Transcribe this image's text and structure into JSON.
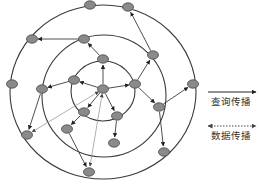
{
  "diagram": {
    "type": "concentric-ring-network",
    "rings": [
      {
        "name": "inner",
        "cx": 103,
        "cy": 91,
        "rx": 32,
        "ry": 30
      },
      {
        "name": "middle",
        "cx": 104,
        "cy": 96,
        "rx": 62,
        "ry": 61
      },
      {
        "name": "outer",
        "cx": 103,
        "cy": 92,
        "rx": 93,
        "ry": 87
      }
    ],
    "nodes": [
      {
        "id": "c",
        "x": 103,
        "y": 89
      },
      {
        "id": "i1",
        "x": 103,
        "y": 59
      },
      {
        "id": "i2",
        "x": 74,
        "y": 80
      },
      {
        "id": "i3",
        "x": 135,
        "y": 84
      },
      {
        "id": "i4",
        "x": 84,
        "y": 112
      },
      {
        "id": "i5",
        "x": 117,
        "y": 116
      },
      {
        "id": "m1",
        "x": 84,
        "y": 39
      },
      {
        "id": "m2",
        "x": 153,
        "y": 55
      },
      {
        "id": "m3",
        "x": 42,
        "y": 89
      },
      {
        "id": "m4",
        "x": 159,
        "y": 107
      },
      {
        "id": "m5",
        "x": 67,
        "y": 129
      },
      {
        "id": "m6",
        "x": 114,
        "y": 143
      },
      {
        "id": "o1",
        "x": 90,
        "y": 5
      },
      {
        "id": "o2",
        "x": 128,
        "y": 7
      },
      {
        "id": "o3",
        "x": 32,
        "y": 39
      },
      {
        "id": "o4",
        "x": 12,
        "y": 84
      },
      {
        "id": "o5",
        "x": 193,
        "y": 84
      },
      {
        "id": "o6",
        "x": 27,
        "y": 135
      },
      {
        "id": "o7",
        "x": 164,
        "y": 152
      },
      {
        "id": "o8",
        "x": 89,
        "y": 172
      }
    ],
    "query_edges": [
      [
        "c",
        "i1"
      ],
      [
        "c",
        "i2"
      ],
      [
        "c",
        "i3"
      ],
      [
        "c",
        "i4"
      ],
      [
        "c",
        "i5"
      ],
      [
        "i1",
        "m1"
      ],
      [
        "i2",
        "m3"
      ],
      [
        "i3",
        "m2"
      ],
      [
        "i3",
        "m4"
      ],
      [
        "i4",
        "m5"
      ],
      [
        "i5",
        "m6"
      ],
      [
        "m1",
        "o3"
      ],
      [
        "m2",
        "o2"
      ],
      [
        "m3",
        "o6"
      ],
      [
        "m4",
        "o5"
      ],
      [
        "m4",
        "o7"
      ],
      [
        "m5",
        "o8"
      ]
    ],
    "data_edges": [
      [
        "c",
        "o6"
      ],
      [
        "c",
        "o8"
      ]
    ],
    "colors": {
      "node_fill": "#8a8a8a",
      "node_stroke": "#4a4a4a",
      "line": "#3a3a3a",
      "data_line": "#9a9a9a"
    }
  },
  "legend": {
    "items": [
      {
        "label": "查询传播",
        "style": "solid-arrow"
      },
      {
        "label": "数据传播",
        "style": "dotted-double-arrow"
      }
    ]
  }
}
